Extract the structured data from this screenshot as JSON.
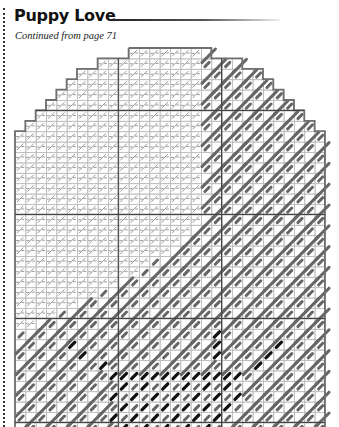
{
  "header": {
    "title": "Puppy Love",
    "subtitle": "Continued from page 71"
  },
  "chart": {
    "type": "needlepoint-stitch-chart",
    "origin": {
      "x": 15,
      "y": 48
    },
    "cell_w": 10.33,
    "cell_h": 10.4,
    "cols": 30,
    "rows": 37,
    "major_every": 10,
    "row_extents": [
      [
        11,
        19
      ],
      [
        8,
        22
      ],
      [
        6,
        24
      ],
      [
        5,
        25
      ],
      [
        4,
        26
      ],
      [
        3,
        27
      ],
      [
        2,
        28
      ],
      [
        1,
        29
      ]
    ],
    "default_extent": [
      0,
      30
    ],
    "dark_start_col": [
      18,
      18,
      18,
      18,
      18,
      18,
      18,
      18,
      18,
      18,
      18,
      18,
      18,
      18,
      18,
      18,
      18,
      17,
      16,
      15,
      13,
      12,
      10,
      8,
      6,
      4,
      2,
      0,
      0,
      0,
      0,
      0,
      0,
      0,
      0,
      0,
      0
    ],
    "black_stitches": [
      [
        27,
        19
      ],
      [
        28,
        19
      ],
      [
        29,
        19
      ],
      [
        28,
        5
      ],
      [
        29,
        6
      ],
      [
        30,
        8
      ],
      [
        28,
        25
      ],
      [
        29,
        24
      ],
      [
        30,
        23
      ],
      [
        31,
        9
      ],
      [
        31,
        10
      ],
      [
        31,
        11
      ],
      [
        31,
        12
      ],
      [
        31,
        13
      ],
      [
        31,
        14
      ],
      [
        31,
        15
      ],
      [
        31,
        16
      ],
      [
        31,
        17
      ],
      [
        31,
        18
      ],
      [
        31,
        19
      ],
      [
        31,
        20
      ],
      [
        31,
        21
      ],
      [
        32,
        10
      ],
      [
        32,
        12
      ],
      [
        32,
        14
      ],
      [
        32,
        16
      ],
      [
        32,
        18
      ],
      [
        32,
        20
      ],
      [
        33,
        9
      ],
      [
        33,
        11
      ],
      [
        33,
        13
      ],
      [
        33,
        15
      ],
      [
        33,
        17
      ],
      [
        33,
        19
      ],
      [
        33,
        21
      ],
      [
        34,
        10
      ],
      [
        34,
        12
      ],
      [
        34,
        14
      ],
      [
        34,
        16
      ],
      [
        34,
        18
      ],
      [
        34,
        20
      ],
      [
        35,
        9
      ],
      [
        35,
        11
      ],
      [
        35,
        13
      ],
      [
        35,
        15
      ],
      [
        35,
        17
      ],
      [
        35,
        19
      ],
      [
        36,
        10
      ],
      [
        36,
        12
      ],
      [
        36,
        14
      ],
      [
        36,
        16
      ],
      [
        36,
        18
      ]
    ],
    "colors": {
      "outline": "#6f6f6f",
      "grid": "#bdbdbd",
      "major": "#444444",
      "light_stitch": "#9a9a9a",
      "dark_stitch": "#666666",
      "black_stitch": "#111111"
    }
  }
}
